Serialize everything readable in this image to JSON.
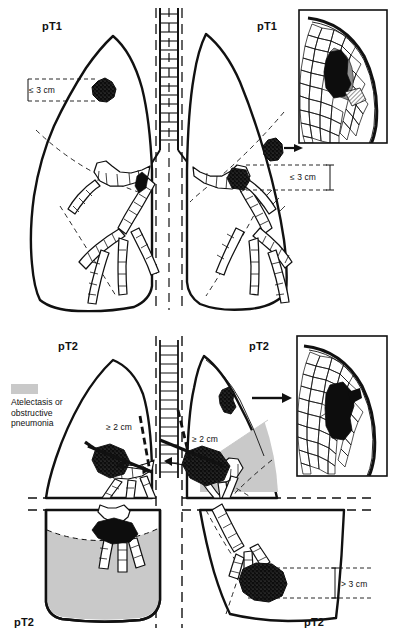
{
  "figure": {
    "type": "medical-diagram",
    "panels": [
      {
        "id": "panel-pt1",
        "stage": "pT1",
        "corner_labels": [
          "pT1",
          "pT1"
        ],
        "description": "Upper panel: peripheral tumour ≤ 3 cm surrounded by lung or visceral pleura, without bronchoscopic evidence of invasion more proximal than the lobar bronchus"
      },
      {
        "id": "panel-pt2",
        "stage": "pT2",
        "corner_labels": [
          "pT2",
          "pT2",
          "pT2",
          "pT2"
        ],
        "description": "Lower panel: tumour > 3 cm, or involving main bronchus ≥ 2 cm distal to carina, or invading visceral pleura, or with associated atelectasis / obstructive pneumonia"
      }
    ],
    "measurements": [
      {
        "id": "m1",
        "text": "≤ 3 cm",
        "panel": "pT1",
        "side": "left"
      },
      {
        "id": "m2",
        "text": "≤ 3 cm",
        "panel": "pT1",
        "side": "right"
      },
      {
        "id": "m3",
        "text": "≥ 2 cm",
        "panel": "pT2",
        "side": "left"
      },
      {
        "id": "m4",
        "text": "≥ 2 cm",
        "panel": "pT2",
        "side": "right"
      },
      {
        "id": "m5",
        "text": "> 3 cm",
        "panel": "pT2",
        "side": "right-lower"
      }
    ],
    "legend": {
      "swatch_color": "#c9c9c9",
      "label": "Atelectasis or\nobstructive\npneumonia"
    },
    "insets": [
      {
        "id": "inset-pt1",
        "panel": "pT1",
        "caption": "",
        "description": "Magnified alveolar/pleural section showing tumour reaching but not breaching the visceral pleura"
      },
      {
        "id": "inset-pt2",
        "panel": "pT2",
        "caption": "",
        "description": "Magnified alveolar/pleural section showing tumour invading the visceral pleura"
      }
    ],
    "colors": {
      "ink": "#111111",
      "atelectasis_gray": "#c9c9c9",
      "tumor_black": "#0d0d0d",
      "paper": "#ffffff"
    }
  }
}
